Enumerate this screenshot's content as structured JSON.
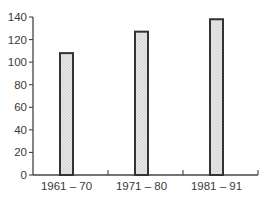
{
  "chart_data": {
    "type": "bar",
    "title": "",
    "xlabel": "",
    "ylabel": "",
    "categories": [
      "1961 – 70",
      "1971 – 80",
      "1981 – 91"
    ],
    "values": [
      108,
      127,
      138
    ],
    "ylim": [
      0,
      140
    ],
    "yticks": [
      0,
      20,
      40,
      60,
      80,
      100,
      120,
      140
    ],
    "grid": false,
    "legend": null,
    "bar_fill": "#e2e2e2",
    "bar_edge": "#333333",
    "axis_color": "#444444"
  }
}
